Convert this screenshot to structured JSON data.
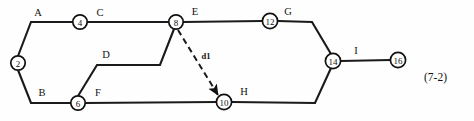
{
  "figure": {
    "caption": "(7-2)",
    "caption_x": 424,
    "caption_y": 71,
    "width": 474,
    "height": 121,
    "background_color": "#fefefe",
    "line_color": "#1a1a1a",
    "node_fill_color": "#ffffff"
  },
  "diagram": {
    "type": "activity-on-arrow-network",
    "nodes": [
      {
        "id": "n2",
        "label": "2",
        "cx": 18,
        "cy": 63,
        "r": 7.2
      },
      {
        "id": "n4",
        "label": "4",
        "cx": 80,
        "cy": 22,
        "r": 7.2
      },
      {
        "id": "n6",
        "label": "6",
        "cx": 78,
        "cy": 103,
        "r": 7.2
      },
      {
        "id": "n8",
        "label": "8",
        "cx": 176,
        "cy": 22,
        "r": 7.2
      },
      {
        "id": "n10",
        "label": "10",
        "cx": 224,
        "cy": 102,
        "r": 7.6
      },
      {
        "id": "n12",
        "label": "12",
        "cx": 270,
        "cy": 21,
        "r": 7.6
      },
      {
        "id": "n14",
        "label": "14",
        "cx": 333,
        "cy": 61,
        "r": 7.6
      },
      {
        "id": "n16",
        "label": "16",
        "cx": 398,
        "cy": 60,
        "r": 7.6
      }
    ],
    "edges": [
      {
        "id": "edge-a",
        "label": "A",
        "from": "n2",
        "to": "n4",
        "style": "solid",
        "points": "18,56 31,22 73,22",
        "label_x": 38,
        "label_y": 12
      },
      {
        "id": "edge-c",
        "label": "C",
        "from": "n4",
        "to": "n8",
        "style": "solid",
        "points": "87,22 169,22",
        "label_x": 100,
        "label_y": 12
      },
      {
        "id": "edge-e",
        "label": "E",
        "from": "n8",
        "to": "n12",
        "style": "solid",
        "points": "183,22 262,21",
        "label_x": 195,
        "label_y": 11
      },
      {
        "id": "edge-g",
        "label": "G",
        "from": "n12",
        "to": "n14",
        "style": "solid",
        "points": "278,21 312,22 331,54",
        "label_x": 288,
        "label_y": 11
      },
      {
        "id": "edge-i",
        "label": "I",
        "from": "n14",
        "to": "n16",
        "style": "solid",
        "points": "341,61 390,60",
        "label_x": 356,
        "label_y": 50
      },
      {
        "id": "edge-b",
        "label": "B",
        "from": "n2",
        "to": "n6",
        "style": "solid",
        "points": "18,70 31,103 71,103",
        "label_x": 42,
        "label_y": 92
      },
      {
        "id": "edge-f",
        "label": "F",
        "from": "n6",
        "to": "n10",
        "style": "solid",
        "points": "85,103 217,102",
        "label_x": 98,
        "label_y": 92
      },
      {
        "id": "edge-h",
        "label": "H",
        "from": "n10",
        "to": "n14",
        "style": "solid",
        "points": "232,102 315,103 331,68",
        "label_x": 244,
        "label_y": 91
      },
      {
        "id": "edge-d",
        "label": "D",
        "from": "n6",
        "to": "n8",
        "style": "solid",
        "points": "78,96 97,65 160,65 174,29",
        "label_x": 106,
        "label_y": 54
      }
    ],
    "dummy_edges": [
      {
        "id": "edge-d1",
        "label": "d1",
        "from": "n8",
        "to": "n10",
        "style": "dashed",
        "arrow": true,
        "points": "178,30 218,95",
        "label_x": 206,
        "label_y": 56
      }
    ]
  }
}
